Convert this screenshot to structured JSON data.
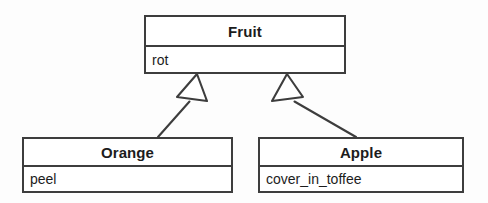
{
  "diagram": {
    "kind": "uml-class-diagram",
    "notation": "generalization",
    "colors": {
      "stroke": "#3d3d3d",
      "fill": "#ffffff",
      "text": "#1c1c1c",
      "background": "#fdfdfd"
    },
    "classes": [
      {
        "id": "fruit",
        "name": "Fruit",
        "role": "superclass",
        "attributes": [
          "rot"
        ]
      },
      {
        "id": "orange",
        "name": "Orange",
        "role": "subclass",
        "attributes": [
          "peel"
        ]
      },
      {
        "id": "apple",
        "name": "Apple",
        "role": "subclass",
        "attributes": [
          "cover_in_toffee"
        ]
      }
    ],
    "relationships": [
      {
        "id": "orange-inherits-fruit",
        "type": "generalization",
        "from": "Orange",
        "to": "Fruit",
        "arrowhead": "hollow-triangle"
      },
      {
        "id": "apple-inherits-fruit",
        "type": "generalization",
        "from": "Apple",
        "to": "Fruit",
        "arrowhead": "hollow-triangle"
      }
    ]
  }
}
